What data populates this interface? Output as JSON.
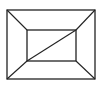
{
  "diagram": {
    "type": "geometric-figure",
    "stroke_color": "#222222",
    "background": "#ffffff",
    "outer_rect": {
      "x1": 7,
      "y1": 10,
      "x2": 95,
      "y2": 79
    },
    "inner_rect": {
      "x1": 27,
      "y1": 30,
      "x2": 76,
      "y2": 61
    },
    "connectors": [
      {
        "name": "top-left",
        "from": [
          7,
          10
        ],
        "to": [
          27,
          30
        ]
      },
      {
        "name": "top-right",
        "from": [
          95,
          10
        ],
        "to": [
          76,
          30
        ]
      },
      {
        "name": "bottom-left",
        "from": [
          7,
          79
        ],
        "to": [
          27,
          61
        ]
      },
      {
        "name": "bottom-right",
        "from": [
          95,
          79
        ],
        "to": [
          76,
          61
        ]
      }
    ],
    "diagonal": {
      "from": [
        27,
        61
      ],
      "to": [
        76,
        30
      ]
    }
  }
}
